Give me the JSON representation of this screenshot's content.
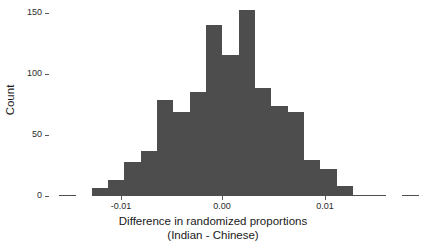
{
  "axes": {
    "y_title": "Count",
    "y_ticks": [
      0,
      50,
      100,
      150
    ],
    "y_tick_labels": [
      "0",
      "50",
      "100",
      "150"
    ],
    "x_ticks": [
      -0.01,
      0.0,
      0.01
    ],
    "x_tick_labels": [
      "-0.01",
      "0.00",
      "0.01"
    ],
    "x_title_line1": "Difference in randomized proportions",
    "x_title_line2": "(Indian - Chinese)"
  },
  "style": {
    "bar_color": "#4d4d4d",
    "background": "#ffffff",
    "text_color": "#1a1a1a",
    "tick_color": "#5a5a5a"
  },
  "chart_data": {
    "type": "bar",
    "title": "",
    "xlabel": "Difference in randomized proportions (Indian - Chinese)",
    "ylabel": "Count",
    "xlim": [
      -0.0165,
      0.0165
    ],
    "ylim": [
      0,
      160
    ],
    "grid": false,
    "legend": null,
    "bin_width": 0.0016,
    "categories": [
      "-0.0152",
      "-0.0136",
      "-0.0120",
      "-0.0104",
      "-0.0088",
      "-0.0072",
      "-0.0056",
      "-0.0040",
      "-0.0024",
      "-0.0008",
      "0.0008",
      "0.0024",
      "0.0040",
      "0.0056",
      "0.0072",
      "0.0088",
      "0.0104",
      "0.0120",
      "0.0136",
      "0.0152"
    ],
    "x": [
      -0.0152,
      -0.0136,
      -0.012,
      -0.0104,
      -0.0088,
      -0.0072,
      -0.0056,
      -0.004,
      -0.0024,
      -0.0008,
      0.0008,
      0.0024,
      0.004,
      0.0056,
      0.0072,
      0.0088,
      0.0104,
      0.012,
      0.0136,
      0.0152
    ],
    "values": [
      1,
      0,
      0,
      7,
      13,
      28,
      37,
      79,
      69,
      86,
      141,
      116,
      153,
      89,
      74,
      69,
      30,
      22,
      8,
      1
    ],
    "bars_px": [
      {
        "left": 59,
        "width": 17,
        "count": 1
      },
      {
        "left": 92,
        "width": 16,
        "count": 7
      },
      {
        "left": 108,
        "width": 16,
        "count": 13
      },
      {
        "left": 124,
        "width": 17,
        "count": 28
      },
      {
        "left": 141,
        "width": 16,
        "count": 37
      },
      {
        "left": 157,
        "width": 16,
        "count": 79
      },
      {
        "left": 173,
        "width": 17,
        "count": 69
      },
      {
        "left": 190,
        "width": 16,
        "count": 86
      },
      {
        "left": 206,
        "width": 16,
        "count": 141
      },
      {
        "left": 222,
        "width": 17,
        "count": 116
      },
      {
        "left": 239,
        "width": 16,
        "count": 153
      },
      {
        "left": 255,
        "width": 16,
        "count": 89
      },
      {
        "left": 271,
        "width": 17,
        "count": 74
      },
      {
        "left": 288,
        "width": 16,
        "count": 69
      },
      {
        "left": 304,
        "width": 16,
        "count": 30
      },
      {
        "left": 320,
        "width": 17,
        "count": 22
      },
      {
        "left": 337,
        "width": 16,
        "count": 8
      },
      {
        "left": 353,
        "width": 16,
        "count": 1
      },
      {
        "left": 369,
        "width": 17,
        "count": 1
      },
      {
        "left": 402,
        "width": 17,
        "count": 1
      }
    ]
  },
  "geometry": {
    "baseline_y": 196,
    "px_per_count": 1.2133,
    "y_tick_px": [
      196,
      135,
      74,
      13
    ],
    "x_tick_px": [
      121,
      222,
      325
    ]
  }
}
